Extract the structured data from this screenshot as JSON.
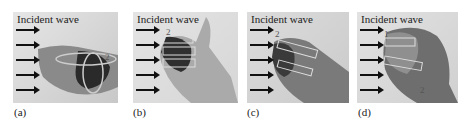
{
  "figure": {
    "panels": [
      {
        "id": "a",
        "label": "(a)",
        "title": "Incident wave",
        "annotations": [
          "2"
        ],
        "arrow_count": 5,
        "description": "flat hand with circular loop arrow"
      },
      {
        "id": "b",
        "label": "(b)",
        "title": "Incident wave",
        "annotations": [
          "2"
        ],
        "arrow_count": 5,
        "description": "open palm with rectangular outlines"
      },
      {
        "id": "c",
        "label": "(c)",
        "title": "Incident wave",
        "annotations": [
          "2"
        ],
        "arrow_count": 5,
        "description": "half-closed hand with rectangular outlines"
      },
      {
        "id": "d",
        "label": "(d)",
        "title": "Incident wave",
        "annotations": [
          "1",
          "2"
        ],
        "arrow_count": 5,
        "description": "closed fist with rectangular outlines"
      }
    ]
  }
}
